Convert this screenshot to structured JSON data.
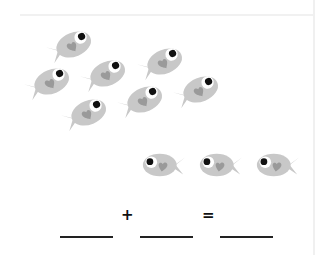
{
  "worksheet": {
    "type": "fish addition exercise",
    "groups": [
      {
        "name": "school-of-fish",
        "count": 7,
        "direction": "right"
      },
      {
        "name": "row-of-fish",
        "count": 3,
        "direction": "left"
      }
    ],
    "equation": {
      "operator_plus": "+",
      "operator_equals": "=",
      "blanks": [
        "",
        "",
        ""
      ]
    },
    "colors": {
      "fish_body": "#c8c8c8",
      "fish_fin": "#c8c8c8",
      "fish_heart": "#9a9a9a",
      "fish_eye_white": "#ffffff",
      "fish_pupil": "#111111"
    }
  }
}
